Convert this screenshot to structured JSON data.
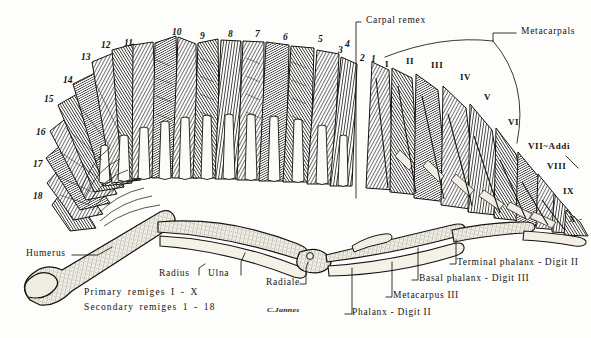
{
  "plate": {
    "title": "Bird wing skeleton and remiges",
    "signature": "C.Jannes",
    "background_color": "#fdfdfb",
    "ink_color": "#141412"
  },
  "secondary_numbers": [
    {
      "label": "18",
      "x": 33,
      "y": 192
    },
    {
      "label": "17",
      "x": 33,
      "y": 160
    },
    {
      "label": "16",
      "x": 36,
      "y": 128
    },
    {
      "label": "15",
      "x": 44,
      "y": 95
    },
    {
      "label": "14",
      "x": 63,
      "y": 76
    },
    {
      "label": "13",
      "x": 81,
      "y": 53
    },
    {
      "label": "12",
      "x": 101,
      "y": 41
    },
    {
      "label": "11",
      "x": 124,
      "y": 39
    },
    {
      "label": "10",
      "x": 172,
      "y": 28
    },
    {
      "label": "9",
      "x": 200,
      "y": 32
    },
    {
      "label": "8",
      "x": 228,
      "y": 30
    },
    {
      "label": "7",
      "x": 255,
      "y": 30
    },
    {
      "label": "6",
      "x": 283,
      "y": 33
    },
    {
      "label": "5",
      "x": 318,
      "y": 35
    },
    {
      "label": "4",
      "x": 345,
      "y": 40
    },
    {
      "label": "3",
      "x": 338,
      "y": 46
    },
    {
      "label": "2",
      "x": 360,
      "y": 54
    },
    {
      "label": "1",
      "x": 371,
      "y": 55
    }
  ],
  "primary_numerals": [
    {
      "label": "I",
      "x": 385,
      "y": 60
    },
    {
      "label": "II",
      "x": 406,
      "y": 57
    },
    {
      "label": "III",
      "x": 431,
      "y": 61
    },
    {
      "label": "IV",
      "x": 460,
      "y": 73
    },
    {
      "label": "V",
      "x": 484,
      "y": 93
    },
    {
      "label": "VI",
      "x": 508,
      "y": 118
    },
    {
      "label": "VII~Addi",
      "x": 528,
      "y": 142
    },
    {
      "label": "VIII",
      "x": 547,
      "y": 162
    },
    {
      "label": "IX",
      "x": 563,
      "y": 187
    },
    {
      "label": "X -",
      "x": 569,
      "y": 215
    }
  ],
  "annotations": {
    "carpal_remex": "Carpal remex",
    "metacarpals": "Metacarpals",
    "humerus": "Humerus",
    "radius": "Radius",
    "ulna": "Ulna",
    "radiale": "Radiale",
    "phalanx_digit_ii": "Phalanx - Digit II",
    "metacarpus_iii": "Metacarpus III",
    "basal_phalanx_digit_iii": "Basal phalanx - Digit III",
    "terminal_phalanx_digit_ii": "Terminal phalanx - Digit II"
  },
  "legend": {
    "primary": "Primary remiges  I - X",
    "secondary": "Secondary remiges  1 - 18"
  }
}
